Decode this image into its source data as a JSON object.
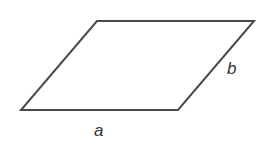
{
  "diagram": {
    "shape": "parallelogram",
    "vertices": [
      [
        97,
        21
      ],
      [
        254,
        21
      ],
      [
        178,
        110
      ],
      [
        21,
        110
      ]
    ],
    "stroke_color": "#4a4a4a",
    "labels": {
      "base": "a",
      "side": "b"
    }
  }
}
